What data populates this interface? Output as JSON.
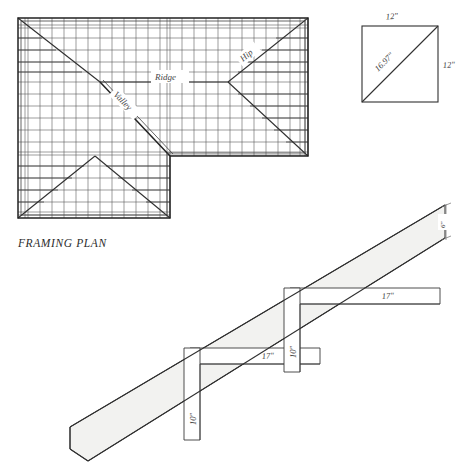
{
  "figure": {
    "caption": "FRAMING PLAN"
  },
  "framing_plan": {
    "caption": "FRAMING PLAN",
    "labels": {
      "ridge": "Ridge",
      "hip": "Hip",
      "valley": "Valley"
    },
    "geometry": {
      "outline_note": "L-shaped hip roof plan",
      "bounds": {
        "x": 18,
        "y": 18,
        "w": 290,
        "h": 200
      },
      "notch": {
        "x": 170,
        "y": 156,
        "w": 138,
        "h": 62
      },
      "ridge_line": {
        "x1": 100,
        "y1": 82,
        "x2": 228,
        "y2": 82
      },
      "hip_lines": [
        {
          "x1": 18,
          "y1": 18,
          "x2": 100,
          "y2": 82
        },
        {
          "x1": 308,
          "y1": 18,
          "x2": 228,
          "y2": 82
        },
        {
          "x1": 308,
          "y1": 156,
          "x2": 228,
          "y2": 82
        },
        {
          "x1": 18,
          "y1": 218,
          "x2": 95,
          "y2": 156
        },
        {
          "x1": 170,
          "y1": 218,
          "x2": 95,
          "y2": 156
        }
      ],
      "valley_line": {
        "x1": 100,
        "y1": 82,
        "x2": 170,
        "y2": 156
      },
      "rafter_spacing_px": 11
    }
  },
  "square_detail": {
    "dimensions": {
      "top": "12\"",
      "right": "12\"",
      "diagonal": "16.97\""
    },
    "geometry": {
      "x": 362,
      "y": 22,
      "size": 76
    }
  },
  "rafter_layout": {
    "dimensions": {
      "upper_run": "17\"",
      "upper_rise": "10\"",
      "lower_run": "17\"",
      "lower_rise": "10\"",
      "end_depth": "6\""
    },
    "geometry": {
      "rafter_top": {
        "x1": 70,
        "y1": 430,
        "x2": 445,
        "y2": 205
      },
      "rafter_bottom": {
        "x1": 78,
        "y1": 458,
        "x2": 445,
        "y2": 238
      },
      "squares": [
        {
          "corner_x": 190,
          "corner_y": 348,
          "blade_len": 140,
          "tongue_len": 90
        },
        {
          "corner_x": 290,
          "corner_y": 288,
          "blade_len": 150,
          "tongue_len": 86
        }
      ]
    }
  },
  "colors": {
    "line": "#3f3f3f",
    "line_bold": "#222222",
    "rafter_fill": "#f2f2f0",
    "text": "#3a3a3a",
    "background": "#ffffff"
  }
}
